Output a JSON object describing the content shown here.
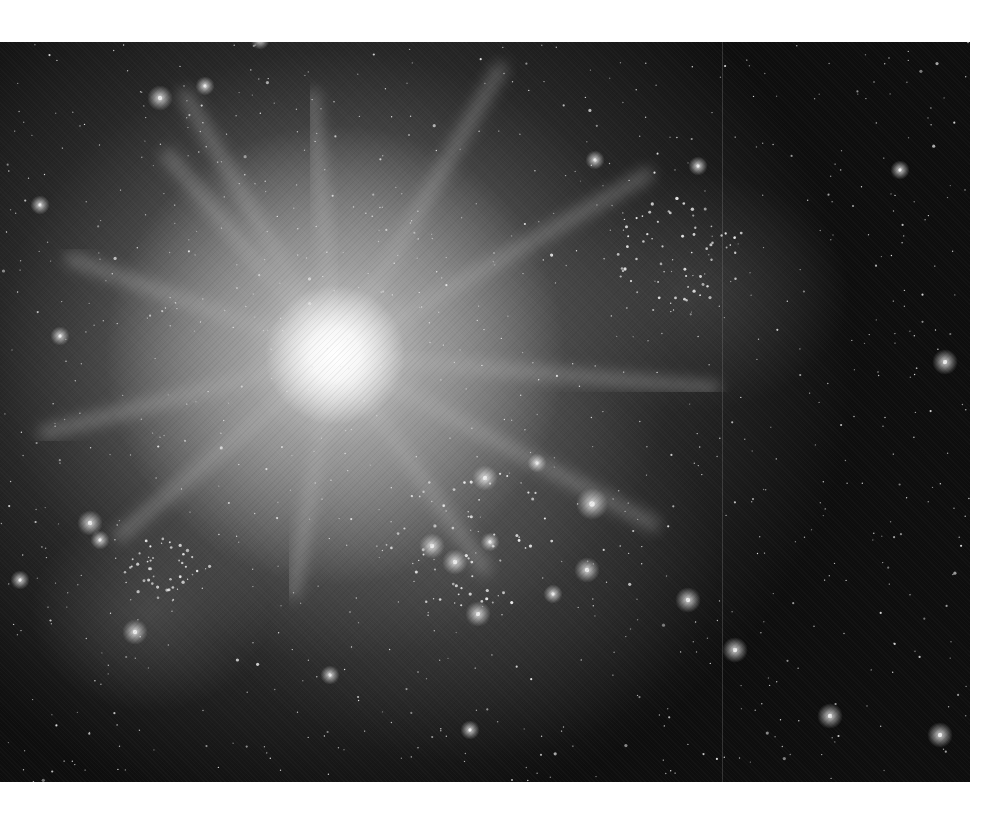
{
  "image": {
    "description": "Grayscale astronomical photograph of a bright galaxy core with radial spikes, star clusters and a dense field of stars",
    "palette": {
      "background_page": "#ffffff",
      "sky_dark": "#0e0e0e",
      "core": "#ffffff",
      "halo": "#9a9a9a"
    },
    "core_center": [
      335,
      313
    ],
    "rays": [
      {
        "angle": -120,
        "length": 300
      },
      {
        "angle": -95,
        "length": 260
      },
      {
        "angle": -60,
        "length": 330
      },
      {
        "angle": -30,
        "length": 360
      },
      {
        "angle": 5,
        "length": 380
      },
      {
        "angle": 28,
        "length": 360
      },
      {
        "angle": 55,
        "length": 260
      },
      {
        "angle": 100,
        "length": 240
      },
      {
        "angle": 140,
        "length": 280
      },
      {
        "angle": 165,
        "length": 300
      },
      {
        "angle": 200,
        "length": 280
      },
      {
        "angle": 230,
        "length": 260
      }
    ],
    "bright_stars": [
      [
        160,
        98,
        4
      ],
      [
        205,
        86,
        3
      ],
      [
        40,
        205,
        3
      ],
      [
        90,
        523,
        4
      ],
      [
        100,
        540,
        3
      ],
      [
        135,
        632,
        4
      ],
      [
        485,
        478,
        4
      ],
      [
        537,
        463,
        3
      ],
      [
        592,
        504,
        5
      ],
      [
        432,
        546,
        4
      ],
      [
        455,
        562,
        4
      ],
      [
        490,
        542,
        3
      ],
      [
        587,
        570,
        4
      ],
      [
        553,
        594,
        3
      ],
      [
        478,
        614,
        4
      ],
      [
        688,
        600,
        4
      ],
      [
        735,
        650,
        4
      ],
      [
        830,
        716,
        4
      ],
      [
        330,
        675,
        3
      ],
      [
        945,
        362,
        4
      ],
      [
        698,
        166,
        3
      ],
      [
        60,
        336,
        3
      ],
      [
        20,
        580,
        3
      ],
      [
        940,
        735,
        4
      ],
      [
        595,
        160,
        3
      ],
      [
        470,
        730,
        3
      ],
      [
        900,
        170,
        3
      ],
      [
        260,
        40,
        3
      ]
    ],
    "clusters": [
      {
        "x": 160,
        "y": 570,
        "r": 40,
        "count": 40
      },
      {
        "x": 680,
        "y": 250,
        "r": 70,
        "count": 60
      },
      {
        "x": 470,
        "y": 540,
        "r": 90,
        "count": 50
      }
    ],
    "field_star_count": 900,
    "seam_x": 722
  }
}
